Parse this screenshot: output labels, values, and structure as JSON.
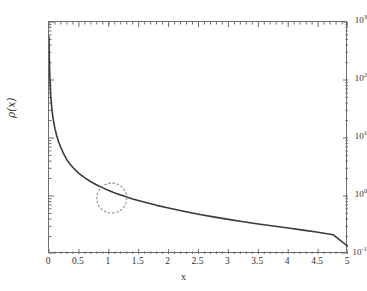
{
  "chart_data": {
    "type": "line",
    "title": "",
    "subtitle": "",
    "xlabel": "x",
    "ylabel": "ρ(x)",
    "xscale": "linear",
    "yscale": "log",
    "xlim": [
      0,
      5
    ],
    "ylim": [
      0.1,
      1000
    ],
    "grid": false,
    "legend": null,
    "xticks": [
      {
        "value": 0,
        "label": "0"
      },
      {
        "value": 0.5,
        "label": "0.5"
      },
      {
        "value": 1,
        "label": "1"
      },
      {
        "value": 1.5,
        "label": "1.5"
      },
      {
        "value": 2,
        "label": "2"
      },
      {
        "value": 2.5,
        "label": "2.5"
      },
      {
        "value": 3,
        "label": "3"
      },
      {
        "value": 3.5,
        "label": "3.5"
      },
      {
        "value": 4,
        "label": "4"
      },
      {
        "value": 4.5,
        "label": "4.5"
      },
      {
        "value": 5,
        "label": "5"
      }
    ],
    "yticks": [
      {
        "value": 1000,
        "mantissa": "10",
        "exponent": "3"
      },
      {
        "value": 100,
        "mantissa": "10",
        "exponent": "2"
      },
      {
        "value": 10,
        "mantissa": "10",
        "exponent": "1"
      },
      {
        "value": 1,
        "mantissa": "10",
        "exponent": "0"
      },
      {
        "value": 0.1,
        "mantissa": "10",
        "exponent": "-1"
      }
    ],
    "series": [
      {
        "name": "rho(x)",
        "color": "#3a3a3a",
        "linewidth": 1.6,
        "x": [
          0.0,
          0.005,
          0.01,
          0.02,
          0.03,
          0.05,
          0.07,
          0.1,
          0.13,
          0.16,
          0.2,
          0.25,
          0.3,
          0.35,
          0.4,
          0.5,
          0.6,
          0.7,
          0.8,
          0.9,
          1.0,
          1.1,
          1.2,
          1.4,
          1.6,
          1.8,
          2.0,
          2.25,
          2.5,
          2.75,
          3.0,
          3.25,
          3.5,
          3.75,
          4.0,
          4.25,
          4.5,
          4.75,
          5.0
        ],
        "y": [
          560,
          250,
          150,
          80.0,
          52.0,
          30.0,
          21.0,
          14.5,
          10.8,
          8.6,
          6.8,
          5.2,
          4.2,
          3.55,
          3.1,
          2.45,
          2.05,
          1.76,
          1.55,
          1.38,
          1.24,
          1.13,
          1.04,
          0.89,
          0.78,
          0.69,
          0.62,
          0.545,
          0.485,
          0.436,
          0.395,
          0.36,
          0.33,
          0.303,
          0.28,
          0.258,
          0.237,
          0.215,
          0.135
        ]
      }
    ],
    "annotations": [
      {
        "kind": "circle",
        "style": "dotted",
        "color": "#8c8c8c",
        "center_x": 1.05,
        "center_y": 0.92,
        "radius_px": 15,
        "label": ""
      }
    ]
  }
}
